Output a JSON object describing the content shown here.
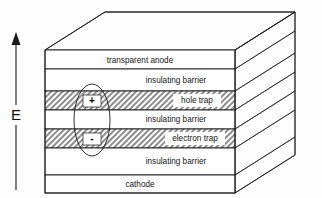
{
  "figure": {
    "background_color": "#ffffff",
    "line_color": "#1a1a1a"
  },
  "field_arrow": {
    "label": "E",
    "direction": "up",
    "name": "electric-field-arrow"
  },
  "stack": {
    "layers": [
      {
        "id": "transparent-anode",
        "label": "transparent anode",
        "fill": "white",
        "label_align": "center",
        "side_fill": "white"
      },
      {
        "id": "insulating-barrier-top",
        "label": "insulating barrier",
        "fill": "white",
        "label_align": "right",
        "side_fill": "white"
      },
      {
        "id": "hole-trap",
        "label": "hole trap",
        "fill": "hatch",
        "label_align": "right",
        "side_fill": "dark"
      },
      {
        "id": "insulating-barrier-middle",
        "label": "insulating barrier",
        "fill": "white",
        "label_align": "right",
        "side_fill": "white"
      },
      {
        "id": "electron-trap",
        "label": "electron  trap",
        "fill": "hatch",
        "label_align": "right",
        "side_fill": "dark"
      },
      {
        "id": "insulating-barrier-bottom",
        "label": "insulating barrier",
        "fill": "white",
        "label_align": "right",
        "side_fill": "white"
      },
      {
        "id": "cathode",
        "label": "cathode",
        "fill": "white",
        "label_align": "center",
        "side_fill": "white"
      }
    ]
  },
  "exciton": {
    "name": "exciton-ellipse",
    "positive_charge": "+",
    "negative_charge": "-"
  },
  "colors": {
    "hatch_gray": "#8d8d8d",
    "dark_face": "#1c1c1c",
    "outline": "#1a1a1a",
    "white_face": "#ffffff"
  }
}
